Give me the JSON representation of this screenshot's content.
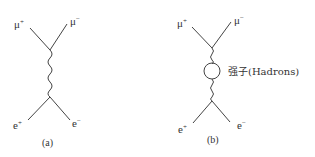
{
  "diagram_a": {
    "caption": "(a)",
    "top_left": "μ",
    "top_left_sup": "+",
    "top_right": "μ",
    "top_right_sup": "−",
    "bottom_left": "e",
    "bottom_left_sup": "+",
    "bottom_right": "e",
    "bottom_right_sup": "−",
    "propagator": "photon"
  },
  "diagram_b": {
    "caption": "(b)",
    "top_left": "μ",
    "top_left_sup": "+",
    "top_right": "μ",
    "top_right_sup": "−",
    "bottom_left": "e",
    "bottom_left_sup": "+",
    "bottom_right": "e",
    "bottom_right_sup": "−",
    "loop_label": "强子(Hadrons)",
    "propagator": "photon with hadronic loop"
  }
}
